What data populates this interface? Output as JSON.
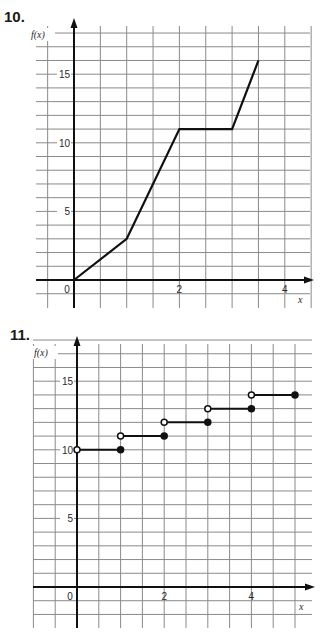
{
  "problems": [
    {
      "number": "10.",
      "y_axis_label": "f(x)",
      "x_axis_label": "x"
    },
    {
      "number": "11.",
      "y_axis_label": "f(x)",
      "x_axis_label": "x"
    }
  ],
  "colors": {
    "grid": "#8a8a8a",
    "axis": "#111111",
    "line": "#111111"
  },
  "chart_data": [
    {
      "type": "line",
      "title": "10.",
      "xlabel": "x",
      "ylabel": "f(x)",
      "x": [
        0,
        1,
        2,
        3,
        3.5
      ],
      "y": [
        0,
        3,
        11,
        11,
        16
      ],
      "x_ticks": [
        0,
        2,
        4
      ],
      "y_ticks": [
        5,
        10,
        15
      ],
      "xlim": [
        -1,
        4.5
      ],
      "ylim": [
        -1,
        18
      ],
      "grid": true,
      "grid_step_x": 0.5,
      "grid_step_y": 1
    },
    {
      "type": "line",
      "subtype": "step",
      "title": "11.",
      "xlabel": "x",
      "ylabel": "f(x)",
      "segments": [
        {
          "x_start": 0,
          "x_end": 1,
          "y": 10,
          "start": "open",
          "end": "closed"
        },
        {
          "x_start": 1,
          "x_end": 2,
          "y": 11,
          "start": "open",
          "end": "closed"
        },
        {
          "x_start": 2,
          "x_end": 3,
          "y": 12,
          "start": "open",
          "end": "closed"
        },
        {
          "x_start": 3,
          "x_end": 4,
          "y": 13,
          "start": "open",
          "end": "closed"
        },
        {
          "x_start": 4,
          "x_end": 5,
          "y": 14,
          "start": "open",
          "end": "closed"
        }
      ],
      "x_ticks": [
        0,
        2,
        4
      ],
      "y_ticks": [
        5,
        10,
        15
      ],
      "xlim": [
        -1,
        5.4
      ],
      "ylim": [
        -2,
        18
      ],
      "grid": true,
      "grid_step_x": 0.5,
      "grid_step_y": 1
    }
  ]
}
